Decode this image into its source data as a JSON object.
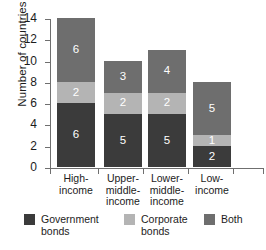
{
  "chart_data": {
    "type": "bar",
    "stacked": true,
    "title": "",
    "xlabel": "",
    "ylabel": "Number of countries",
    "ylim": [
      0,
      14
    ],
    "ytick_step": 2,
    "yticks": [
      0,
      2,
      4,
      6,
      8,
      10,
      12,
      14
    ],
    "grid": false,
    "legend_position": "bottom",
    "categories": [
      "High-\nincome",
      "Upper-\nmiddle-\nincome",
      "Lower-\nmiddle-\nincome",
      "Low-\nincome"
    ],
    "series": [
      {
        "name": "Government\nbonds",
        "color": "#3b3b3b",
        "values": [
          6,
          5,
          5,
          2
        ]
      },
      {
        "name": "Corporate\nbonds",
        "color": "#b4b4b4",
        "values": [
          2,
          2,
          2,
          1
        ]
      },
      {
        "name": "Both",
        "color": "#6e6e6e",
        "values": [
          6,
          3,
          4,
          5
        ]
      }
    ],
    "totals": [
      14,
      10,
      11,
      8
    ]
  }
}
